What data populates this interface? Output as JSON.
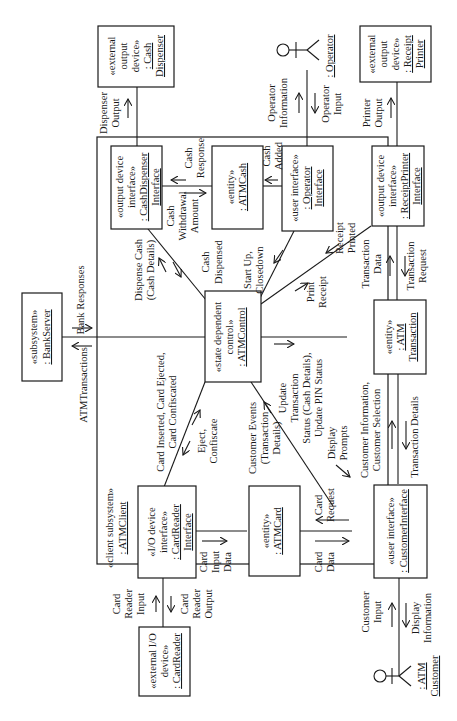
{
  "diagram": {
    "orientation": "rotated 90 degrees counter-clockwise",
    "colors": {
      "stroke": "#1a1a1a",
      "background": "#ffffff"
    }
  },
  "external": {
    "cash_dispenser": {
      "line1": "«external",
      "line2": "output",
      "line3": "device»",
      "line4": ": Cash",
      "line5": "Dispenser"
    },
    "receipt_printer": {
      "line1": "«external",
      "line2": "output",
      "line3": "device»",
      "line4": ": Receipt",
      "line5": "Printer"
    },
    "card_reader": {
      "line1": "«external I/O",
      "line2": "device»",
      "line3": ": CardReader"
    },
    "bank_server": {
      "line1": "«subsystem»",
      "line2": ": BankServer"
    },
    "operator_actor": {
      "name": ": Operator"
    },
    "customer_actor": {
      "line1": ": ATM",
      "line2": "Customer"
    }
  },
  "subsystem": {
    "stereotype": "«client subsystem»",
    "name": ": ATMClient"
  },
  "objects": {
    "cash_dispenser_interface": {
      "line1": "«output device",
      "line2": "interface»",
      "line3": ": CashDispenser",
      "line4": "Interface"
    },
    "atm_cash": {
      "line1": "«entity»",
      "line2": ": ATMCash"
    },
    "operator_interface": {
      "line1": "«user interface»",
      "line2": ": Operator",
      "line3": "Interface"
    },
    "receipt_printer_interface": {
      "line1": "«output device",
      "line2": "interface»",
      "line3": ": ReceiptPrinter",
      "line4": "Interface"
    },
    "atm_control": {
      "line1": "«state dependent",
      "line2": "control»",
      "line3": ": ATMControl"
    },
    "atm_transaction": {
      "line1": "«entity»",
      "line2": ": ATM",
      "line3": "Transaction"
    },
    "card_reader_interface": {
      "line1": "«I/O device",
      "line2": "interface»",
      "line3": ": CardReader",
      "line4": "Interface"
    },
    "atm_card": {
      "line1": "«entity»",
      "line2": ": ATMCard"
    },
    "customer_interface": {
      "line1": "«user interface»",
      "line2": ": CustomerInterface"
    }
  },
  "messages": {
    "dispenser_output": {
      "line1": "Dispenser",
      "line2": "Output"
    },
    "operator_information": {
      "line1": "Operator",
      "line2": "Information"
    },
    "operator_input": {
      "line1": "Operator",
      "line2": "Input"
    },
    "printer_output": {
      "line1": "Printer",
      "line2": "Output"
    },
    "cash_response": {
      "line1": "Cash",
      "line2": "Response"
    },
    "cash_withdrawal_amount": {
      "line1": "Cash",
      "line2": "Withdrawal",
      "line3": "Amount"
    },
    "cash_added": {
      "line1": "Cash",
      "line2": "Added"
    },
    "dispense_cash": {
      "line1": "Dispense Cash",
      "line2": "(Cash Details)"
    },
    "cash_dispensed": {
      "line1": "Cash",
      "line2": "Dispensed"
    },
    "start_up": {
      "line1": "Start Up,",
      "line2": "Closedown"
    },
    "receipt_printed": {
      "line1": "Receipt",
      "line2": "Printed"
    },
    "print_receipt": {
      "line1": "Print",
      "line2": "Receipt"
    },
    "transaction_data": {
      "line1": "Transaction",
      "line2": "Data"
    },
    "transaction_request": {
      "line1": "Transaction",
      "line2": "Request"
    },
    "bank_responses": "Bank Responses",
    "atm_transactions": "ATMTransactions",
    "card_inserted": {
      "line1": "Card Inserted, Card Ejected,",
      "line2": "Card Confiscated"
    },
    "eject_confiscate": {
      "line1": "Eject,",
      "line2": "Confiscate"
    },
    "update_transaction": {
      "line1": "Update",
      "line2": "Transaction",
      "line3": "Status (Cash Details),",
      "line4": "Update PIN Status"
    },
    "customer_events": {
      "line1": "Customer Events",
      "line2": "(Transaction",
      "line3": "Details)"
    },
    "display_prompts": {
      "line1": "Display",
      "line2": "Prompts"
    },
    "customer_information": {
      "line1": "Customer Information,",
      "line2": "Customer Selection"
    },
    "transaction_details": "Transaction Details",
    "card_input_data": {
      "line1": "Card",
      "line2": "Input",
      "line3": "Data"
    },
    "card_request": {
      "line1": "Card",
      "line2": "Request"
    },
    "card_data": {
      "line1": "Card",
      "line2": "Data"
    },
    "card_reader_input": {
      "line1": "Card",
      "line2": "Reader",
      "line3": "Input"
    },
    "card_reader_output": {
      "line1": "Card",
      "line2": "Reader",
      "line3": "Output"
    },
    "customer_input": {
      "line1": "Customer",
      "line2": "Input"
    },
    "display_information": {
      "line1": "Display",
      "line2": "Information"
    }
  }
}
